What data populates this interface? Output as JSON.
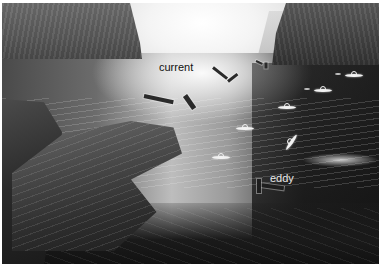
{
  "image": {
    "description": "Grayscale photo of a sea channel between two cliffs with kayakers, annotated to show current and eddy",
    "colors": {
      "border": "#ffffff",
      "label_current": "#111111",
      "label_eddy": "#e8e8e8",
      "arrow": "#2a2a2a",
      "kayak": "#f2f2f2"
    }
  },
  "annotations": {
    "current_label": "current",
    "eddy_label": "eddy",
    "arrows": [
      {
        "name": "current-arrow-upper",
        "x": 214,
        "y": 66,
        "length": 18,
        "angle": 35
      },
      {
        "name": "current-arrow-upper-2",
        "x": 229,
        "y": 79,
        "length": 12,
        "angle": -35
      },
      {
        "name": "current-arrow-far",
        "x": 256,
        "y": 59,
        "length": 8,
        "angle": 25
      },
      {
        "name": "current-arrow-lower",
        "x": 144,
        "y": 94,
        "length": 30,
        "angle": 12
      },
      {
        "name": "eddy-arrow",
        "x": 258,
        "y": 185,
        "length": 26,
        "angle": 6
      }
    ],
    "kayaks": [
      {
        "x": 345,
        "y": 72
      },
      {
        "x": 312,
        "y": 86
      },
      {
        "x": 278,
        "y": 104
      },
      {
        "x": 236,
        "y": 126
      },
      {
        "x": 213,
        "y": 154
      },
      {
        "x": 283,
        "y": 137
      }
    ]
  }
}
